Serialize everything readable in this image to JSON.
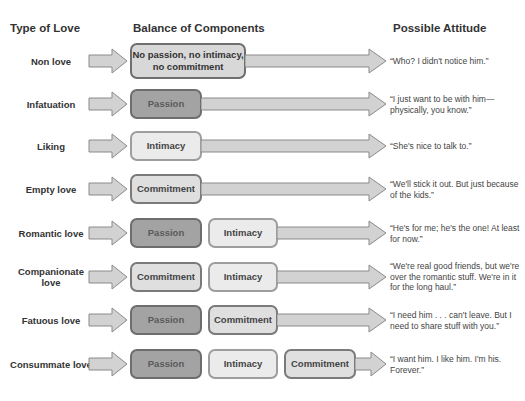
{
  "headers": {
    "type_of_love": "Type of Love",
    "balance_of_components": "Balance of Components",
    "possible_attitude": "Possible Attitude"
  },
  "colors": {
    "passion_fill": "#a3a3a3",
    "intimacy_fill": "#ebebeb",
    "commitment_fill": "#dfdfdf",
    "arrow_fill": "#d2d2d2",
    "arrow_stroke": "#8a8a8a"
  },
  "rows": [
    {
      "type": "Non love",
      "components": [
        "No passion, no intimacy, no commitment"
      ],
      "attitude": "“Who? I didn't notice him.”"
    },
    {
      "type": "Infatuation",
      "components": [
        "Passion"
      ],
      "attitude": "“I just want to be with him—physically, you know.”"
    },
    {
      "type": "Liking",
      "components": [
        "Intimacy"
      ],
      "attitude": "“She's nice to talk to.”"
    },
    {
      "type": "Empty love",
      "components": [
        "Commitment"
      ],
      "attitude": "“We'll stick it out. But just because of the kids.”"
    },
    {
      "type": "Romantic love",
      "components": [
        "Passion",
        "Intimacy"
      ],
      "attitude": "“He's for me; he's the one! At least for now.”"
    },
    {
      "type": "Companionate love",
      "components": [
        "Commitment",
        "Intimacy"
      ],
      "attitude": "“We're real good friends, but we're over the romantic stuff. We're in it for the long haul.”"
    },
    {
      "type": "Fatuous love",
      "components": [
        "Passion",
        "Commitment"
      ],
      "attitude": "“I need him . . . can't leave. But I need to share stuff with you.”"
    },
    {
      "type": "Consummate love",
      "components": [
        "Passion",
        "Intimacy",
        "Commitment"
      ],
      "attitude": "“I want him. I like him. I'm his. Forever.”"
    }
  ]
}
